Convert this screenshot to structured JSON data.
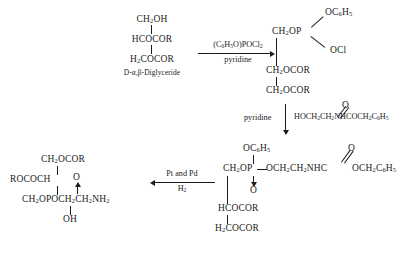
{
  "scheme": {
    "title": "Synthesis of a phosphatidylethanolamine from a D-alpha,beta-diglyceride",
    "structures": {
      "diglyceride": {
        "name": "d-alpha,beta-diglyceride",
        "line1": "CH2OH",
        "line1_html": "CH<sub>2</sub>OH",
        "line2": "HCOCOR",
        "line3": "H2COCOR",
        "line3_html": "H<sub>2</sub>COCOR",
        "caption": "D-α,β-Diglyceride"
      },
      "chlorophosphate": {
        "name": "phenyl-chloro-phosphate-diglyceride",
        "top_branch": "OC6H5",
        "top_branch_html": "OC<sub>6</sub>H<sub>5</sub>",
        "bottom_branch": "OCl",
        "stem": "CH2OP",
        "stem_html": "CH<sub>2</sub>OP",
        "line2": "CH2OCOR",
        "line2_html": "CH<sub>2</sub>OCOR",
        "line3": "CH2OCOR",
        "line3_html": "CH<sub>2</sub>OCOR"
      },
      "protected_phosphatide": {
        "name": "phenyl-phosphate-n-phenylacetyl-ethanolamine-diglyceride",
        "top_branch": "OC6H5",
        "top_branch_html": "OC<sub>6</sub>H<sub>5</sub>",
        "stem": "CH2OP",
        "stem_html": "CH<sub>2</sub>OP",
        "phospho_oxygen": "O",
        "bridge": "OCH2CH2NHC",
        "bridge_html": "—OCH<sub>2</sub>CH<sub>2</sub>NHC",
        "amide_oxygen": "O",
        "tail": "OCH2C6H5",
        "tail_html": "OCH<sub>2</sub>C<sub>6</sub>H<sub>5</sub>",
        "line2": "HCOCOR",
        "line3": "H2COCOR",
        "line3_html": "H<sub>2</sub>COCOR"
      },
      "cephalin": {
        "name": "phosphatidylethanolamine-product",
        "line1": "CH2OCOR",
        "line1_html": "CH<sub>2</sub>OCOR",
        "line2": "ROCOCH",
        "phospho_oxygen": "O",
        "line3": "CH2OPOCH2CH2NH2",
        "line3_html": "CH<sub>2</sub>OPOCH<sub>2</sub>CH<sub>2</sub>NH<sub>2</sub>",
        "line4": "OH"
      }
    },
    "arrows": {
      "step1": {
        "name": "phosphorylation-arrow",
        "direction": "right",
        "reagent_above": "(C6H5O)POCl2",
        "reagent_above_html": "(C<sub>6</sub>H<sub>5</sub>O)POCl<sub>2</sub>",
        "reagent_below": "pyridine"
      },
      "step2": {
        "name": "esterification-arrow",
        "direction": "down",
        "reagent_left": "pyridine",
        "reagent_right": "HOCH2CH2NHCOCH2C6H5",
        "reagent_right_lead_html": "HOCH<sub>2</sub>CH<sub>2</sub>NHC",
        "reagent_right_tail_html": "OCH<sub>2</sub>C<sub>6</sub>H<sub>5</sub>",
        "reagent_right_oxygen": "O"
      },
      "step3": {
        "name": "hydrogenolysis-arrow",
        "direction": "left",
        "reagent_above": "Pt and Pd",
        "reagent_below": "H2",
        "reagent_below_html": "H<sub>2</sub>"
      }
    },
    "colors": {
      "ink": "#1b1b1b",
      "background": "#ffffff"
    }
  }
}
